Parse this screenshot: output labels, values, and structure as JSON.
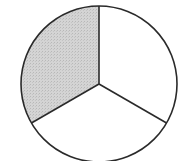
{
  "diagram": {
    "type": "fraction-circle",
    "parts_total": 3,
    "parts_shaded": 1,
    "fraction": "1/3",
    "center": [
      99,
      84
    ],
    "radius": 78,
    "sectors": [
      {
        "name": "upper-left",
        "start_deg": -90,
        "end_deg": 150,
        "shaded": true
      },
      {
        "name": "right",
        "start_deg": -90,
        "end_deg": 30,
        "shaded": false
      },
      {
        "name": "bottom",
        "start_deg": 30,
        "end_deg": 150,
        "shaded": false
      }
    ],
    "colors": {
      "shade": "#cfcfcf",
      "stroke": "#2a2a2a",
      "background": "#ffffff"
    }
  }
}
